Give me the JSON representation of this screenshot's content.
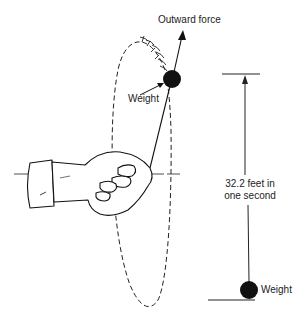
{
  "diagram": {
    "labels": {
      "outward_force": "Outward force",
      "weight_top": "Weight",
      "distance_line1": "32.2 feet in",
      "distance_line2": "one second",
      "weight_bottom": "Weight"
    },
    "colors": {
      "ink": "#1a1a1a",
      "background": "#ffffff"
    }
  }
}
